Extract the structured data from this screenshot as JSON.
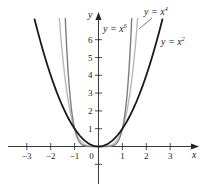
{
  "chart_data": {
    "type": "line",
    "title": "",
    "xlabel": "x",
    "ylabel": "y",
    "xlim": [
      -3.9,
      4.2
    ],
    "ylim": [
      -2.1,
      7.5
    ],
    "x_ticks": [
      -3,
      -2,
      -1,
      0,
      1,
      2,
      3
    ],
    "x_tick_labels": [
      "−3",
      "−2",
      "−1",
      "0",
      "1",
      "2",
      "3"
    ],
    "y_ticks": [
      -1,
      1,
      2,
      3,
      4,
      5,
      6
    ],
    "y_tick_labels": [
      "",
      "1",
      "2",
      "3",
      "4",
      "5",
      "6"
    ],
    "grid": false,
    "legend": "inline labels",
    "series": [
      {
        "name": "y = x^2",
        "label": "y = x",
        "exponent_label": "2",
        "power": 2,
        "color": "#1a1a1a",
        "x_range": [
          -2.68,
          2.68
        ]
      },
      {
        "name": "y = x^4",
        "label": "y = x",
        "exponent_label": "4",
        "power": 4,
        "color": "#b8b8b8",
        "x_range": [
          -1.64,
          1.64
        ]
      },
      {
        "name": "y = x^6",
        "label": "y = x",
        "exponent_label": "6",
        "power": 6,
        "color": "#7e7e7e",
        "x_range": [
          -1.39,
          1.39
        ]
      }
    ],
    "annotations": [
      "y = x^6",
      "y = x^4",
      "y = x^2"
    ]
  }
}
